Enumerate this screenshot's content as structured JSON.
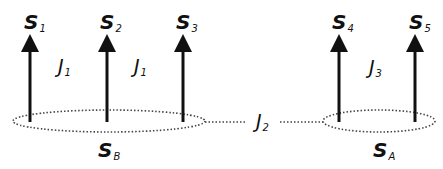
{
  "spins": [
    {
      "label": "S",
      "sub": "1"
    },
    {
      "label": "S",
      "sub": "2"
    },
    {
      "label": "S",
      "sub": "3"
    },
    {
      "label": "S",
      "sub": "4"
    },
    {
      "label": "S",
      "sub": "5"
    }
  ],
  "couplings": [
    {
      "label": "J",
      "sub": "1"
    },
    {
      "label": "J",
      "sub": "1"
    },
    {
      "label": "J",
      "sub": "2"
    },
    {
      "label": "J",
      "sub": "3"
    }
  ],
  "clusters": [
    {
      "label": "S",
      "sub": "B"
    },
    {
      "label": "S",
      "sub": "A"
    }
  ]
}
